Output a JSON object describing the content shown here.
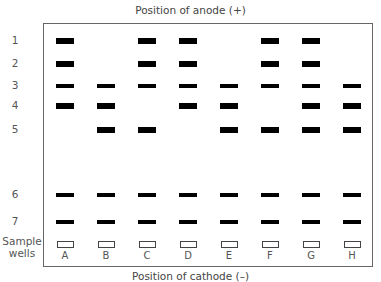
{
  "title_top": "Position of anode (+)",
  "title_bottom": "Position of cathode (–)",
  "wells_label_1": "Sample",
  "wells_label_2": "wells",
  "rows": [
    {
      "label": "1",
      "y": 41,
      "style": "thick"
    },
    {
      "label": "2",
      "y": 64,
      "style": "thick"
    },
    {
      "label": "3",
      "y": 86,
      "style": "thin"
    },
    {
      "label": "4",
      "y": 106,
      "style": "thick"
    },
    {
      "label": "5",
      "y": 130,
      "style": "thick"
    },
    {
      "label": "6",
      "y": 195,
      "style": "thin"
    },
    {
      "label": "7",
      "y": 222,
      "style": "thin"
    }
  ],
  "lanes": [
    {
      "label": "A",
      "x": 65,
      "bands": [
        1,
        2,
        3,
        4,
        6,
        7
      ]
    },
    {
      "label": "B",
      "x": 106,
      "bands": [
        3,
        4,
        5,
        6,
        7
      ]
    },
    {
      "label": "C",
      "x": 147,
      "bands": [
        1,
        2,
        3,
        5,
        6,
        7
      ]
    },
    {
      "label": "D",
      "x": 188,
      "bands": [
        1,
        2,
        3,
        4,
        6,
        7
      ]
    },
    {
      "label": "E",
      "x": 229,
      "bands": [
        3,
        4,
        5,
        6,
        7
      ]
    },
    {
      "label": "F",
      "x": 270,
      "bands": [
        1,
        2,
        3,
        5,
        6,
        7
      ]
    },
    {
      "label": "G",
      "x": 311,
      "bands": [
        1,
        2,
        3,
        4,
        5,
        6,
        7
      ]
    },
    {
      "label": "H",
      "x": 352,
      "bands": [
        3,
        4,
        5,
        6,
        7
      ]
    }
  ]
}
